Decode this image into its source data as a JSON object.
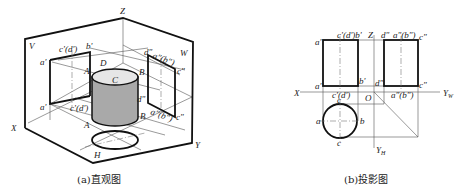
{
  "figure_a": {
    "caption": "(a)直观图",
    "planes": {
      "V": "V",
      "W": "W",
      "H": "H"
    },
    "axes": {
      "X": "X",
      "Y": "Y",
      "Z": "Z"
    },
    "points_3d": {
      "A_top": "A",
      "A_bottom": "A",
      "B_top": "B",
      "B_bottom": "B",
      "C": "C",
      "D": "D"
    },
    "v_projection_labels": {
      "a_top": "a'",
      "a_bottom": "a'",
      "cd_top": "c'(d')",
      "cd_bottom": "c'(d')",
      "b_top": "b'"
    },
    "w_projection_labels": {
      "d_top": "d\"",
      "ab_top": "a\"(b\")",
      "c_top": "c\"",
      "d_bottom": "d\"",
      "ab_bottom": "a\"(b\")",
      "c_bottom": "c\""
    },
    "colors": {
      "cylinder_side": "#a9a9a9",
      "cylinder_top": "#e6e6e6",
      "line": "#111111"
    }
  },
  "figure_b": {
    "caption": "(b)投影图",
    "axes": {
      "X": "X",
      "Z": "Z",
      "O": "O",
      "YW": "Y",
      "YW_sub": "W",
      "YH": "Y",
      "YH_sub": "H"
    },
    "front_view_labels": {
      "a_top": "a'",
      "cdb_top": "c'(d')b'",
      "a_bottom": "a'",
      "b_bottom": "b'",
      "cd_bottom": "c'(d')"
    },
    "side_view_labels": {
      "d_top": "d\"",
      "ab_top": "a\"(b\")",
      "c_top": "c\"",
      "d_bottom": "d\"",
      "c_bottom": "c\"",
      "ab_bottom": "a\"(b\")"
    },
    "top_view_labels": {
      "c_top": "c",
      "a": "a",
      "b": "b",
      "c_bottom": "c"
    }
  }
}
